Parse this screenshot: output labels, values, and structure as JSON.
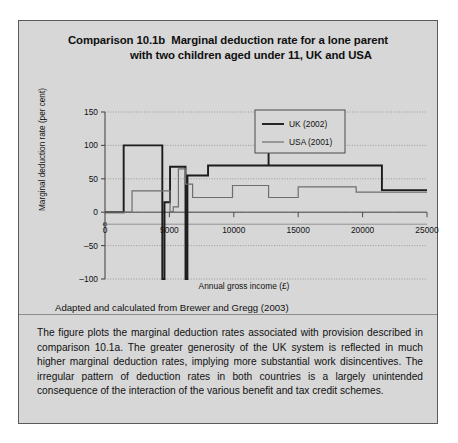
{
  "figure": {
    "number": "Comparison 10.1b",
    "title_line1": "Marginal deduction rate for a lone parent",
    "title_line2": "with two children aged under 11, UK and USA",
    "source": "Adapted and calculated from Brewer and Gregg (2003)",
    "commentary": "The figure plots the marginal deduction rates associated with provision described in comparison 10.1a. The greater generosity of the UK system is reflected in much higher marginal deduction rates, implying more substantial work disincentives. The irregular pattern of deduction rates in both countries is a largely unintended consequence of the interaction of the various benefit and tax credit schemes."
  },
  "colors": {
    "panel_background": "#d7d7d7",
    "panel_border": "#5a5a5a",
    "uk_line": "#1c1c1c",
    "usa_line": "#6e6e6e",
    "grid": "#8a8a8a",
    "axis": "#4a4a4a",
    "text": "#111111"
  },
  "chart_data": {
    "type": "line",
    "title": "Marginal deduction rate for a lone parent with two children aged under 11, UK and USA",
    "xlabel": "Annual gross income (£)",
    "ylabel": "Marginal deduction rate (per cent)",
    "xlim": [
      0,
      25000
    ],
    "ylim": [
      -100,
      150
    ],
    "xticks": [
      0,
      5000,
      10000,
      15000,
      20000,
      25000
    ],
    "xticklabels": [
      "0",
      "5000",
      "10000",
      "15000",
      "20000",
      "25000"
    ],
    "yticks": [
      -100,
      -50,
      0,
      50,
      100,
      150
    ],
    "yticklabels": [
      "–100",
      "–50",
      "0",
      "50",
      "100",
      "150"
    ],
    "grid": "horizontal-dotted",
    "legend_position": "top-right",
    "step": "post",
    "series": [
      {
        "name": "UK (2002)",
        "color": "#1c1c1c",
        "points": [
          [
            0,
            0
          ],
          [
            1450,
            0
          ],
          [
            1450,
            100
          ],
          [
            4450,
            100
          ],
          [
            4450,
            -100
          ],
          [
            4620,
            -100
          ],
          [
            4620,
            15
          ],
          [
            5050,
            15
          ],
          [
            5050,
            68
          ],
          [
            6250,
            68
          ],
          [
            6250,
            -100
          ],
          [
            6400,
            -100
          ],
          [
            6400,
            55
          ],
          [
            8000,
            55
          ],
          [
            8000,
            70
          ],
          [
            12700,
            70
          ],
          [
            12700,
            150
          ],
          [
            12700,
            70
          ],
          [
            21500,
            70
          ],
          [
            21500,
            33
          ],
          [
            25000,
            33
          ]
        ]
      },
      {
        "name": "USA (2001)",
        "color": "#6e6e6e",
        "points": [
          [
            0,
            0
          ],
          [
            2100,
            0
          ],
          [
            2100,
            32
          ],
          [
            5050,
            32
          ],
          [
            5050,
            1
          ],
          [
            5300,
            1
          ],
          [
            5300,
            8
          ],
          [
            5700,
            8
          ],
          [
            5700,
            65
          ],
          [
            6250,
            65
          ],
          [
            6250,
            42
          ],
          [
            6800,
            42
          ],
          [
            6800,
            22
          ],
          [
            9900,
            22
          ],
          [
            9900,
            40
          ],
          [
            12700,
            40
          ],
          [
            12700,
            22
          ],
          [
            15000,
            22
          ],
          [
            15000,
            38
          ],
          [
            19500,
            38
          ],
          [
            19500,
            30
          ],
          [
            25000,
            30
          ]
        ]
      }
    ]
  }
}
